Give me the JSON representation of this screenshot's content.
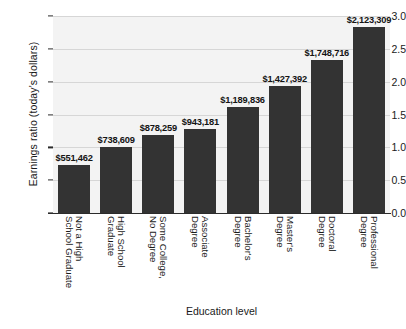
{
  "chart_data": {
    "type": "bar",
    "title": "",
    "xlabel": "Education level",
    "ylabel": "Earnings ratio (today's dollars)",
    "ylim": [
      0.0,
      3.0
    ],
    "yticks": [
      "0.0",
      "0.5",
      "1.0",
      "1.5",
      "2.0",
      "2.5",
      "3.0"
    ],
    "ytick_values": [
      0.0,
      0.5,
      1.0,
      1.5,
      2.0,
      2.5,
      3.0
    ],
    "grid": true,
    "legend": "none",
    "bar_color": "#333333",
    "plot_background": "#f3f3f3",
    "gridline_color": "#d6d6d6",
    "categories": [
      "Not a High School Graduate",
      "High School Graduate",
      "Some College, No Degree",
      "Associate Degree",
      "Bachelor's Degree",
      "Master's Degree",
      "Doctoral Degree",
      "Professional Degree"
    ],
    "category_lines": [
      [
        "Not a High",
        "School Graduate"
      ],
      [
        "High School",
        "Graduate"
      ],
      [
        "Some College,",
        "No Degree"
      ],
      [
        "Associate",
        "Degree"
      ],
      [
        "Bachelor's",
        "Degree"
      ],
      [
        "Master's",
        "Degree"
      ],
      [
        "Doctoral",
        "Degree"
      ],
      [
        "Professional",
        "Degree"
      ]
    ],
    "values": [
      0.73,
      1.0,
      1.19,
      1.28,
      1.61,
      1.93,
      2.33,
      2.83
    ],
    "data_labels": [
      "$551,462",
      "$738,609",
      "$878,259",
      "$943,181",
      "$1,189,836",
      "$1,427,392",
      "$1,748,716",
      "$2,123,309"
    ]
  }
}
